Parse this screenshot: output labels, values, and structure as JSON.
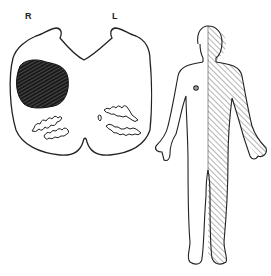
{
  "figure": {
    "spinal_cord": {
      "labels": {
        "right": "R",
        "left": "L"
      },
      "lesion_side": "right",
      "lesion_color": "#1a1a1a"
    },
    "body_figure": {
      "affected_side": "left",
      "hatch_color": "#444444"
    },
    "colors": {
      "line": "#222222",
      "background": "#ffffff"
    }
  }
}
